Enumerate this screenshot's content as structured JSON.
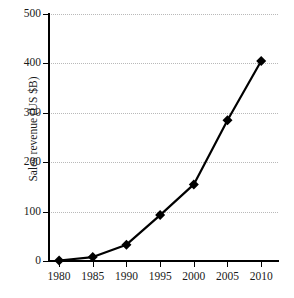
{
  "chart_data": {
    "type": "line",
    "title": "",
    "xlabel": "",
    "ylabel": "Sales revenue (US $B)",
    "x": [
      1980,
      1985,
      1990,
      1995,
      2000,
      2005,
      2010
    ],
    "categories": [
      "1980",
      "1985",
      "1990",
      "1995",
      "2000",
      "2005",
      "2010"
    ],
    "values": [
      1,
      8,
      33,
      93,
      155,
      285,
      405
    ],
    "series": [
      {
        "name": "Sales revenue",
        "values": [
          1,
          8,
          33,
          93,
          155,
          285,
          405
        ],
        "color": "#000000",
        "marker": "diamond",
        "line_width": 2.2
      }
    ],
    "xlim": [
      1978.5,
      2012.5
    ],
    "ylim": [
      0,
      500
    ],
    "xticks": [
      1980,
      1985,
      1990,
      1995,
      2000,
      2005,
      2010
    ],
    "xtick_labels": [
      "1980",
      "1985",
      "1990",
      "1995",
      "2000",
      "2005",
      "2010"
    ],
    "yticks": [
      0,
      100,
      200,
      300,
      400,
      500
    ],
    "ytick_labels": [
      "0",
      "100",
      "200",
      "300",
      "400",
      "500"
    ],
    "grid": "horizontal-dotted",
    "grid_color": "#b9b9b9",
    "legend": "none",
    "background": "#ffffff",
    "axis_color": "#000000"
  }
}
